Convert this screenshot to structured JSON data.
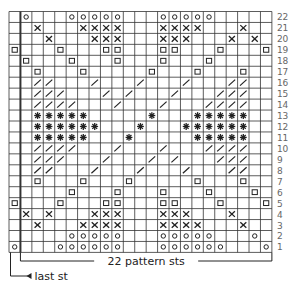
{
  "chart_data": {
    "type": "knitting-chart",
    "columns": 23,
    "rows": 22,
    "column_order_note": "index 0 = leftmost column (last st); indices 1-22 = pattern stitches",
    "legend_symbols": {
      "o": "circle",
      "x": "cross",
      "sq": "small-square",
      "sl": "diagonal-slash",
      "st": "asterisk"
    },
    "grid": [
      {
        "row": 22,
        "o": [
          1,
          5,
          6,
          7,
          8,
          9,
          13,
          14,
          15,
          16,
          17
        ]
      },
      {
        "row": 21,
        "x": [
          2,
          6,
          7,
          8,
          9,
          13,
          14,
          15,
          16,
          20
        ]
      },
      {
        "row": 20,
        "x": [
          3,
          7,
          8,
          9,
          13,
          14,
          15,
          19,
          21
        ]
      },
      {
        "row": 19,
        "sq": [
          0,
          4,
          8,
          9,
          13,
          14,
          18,
          22
        ]
      },
      {
        "row": 18,
        "sq": [
          1,
          5,
          9,
          13,
          17
        ]
      },
      {
        "row": 17,
        "sq": [
          2,
          6,
          12,
          16,
          20
        ]
      },
      {
        "row": 16,
        "sl": [
          2,
          3,
          7,
          11,
          15,
          19,
          20
        ]
      },
      {
        "row": 15,
        "sl": [
          2,
          3,
          4,
          8,
          10,
          14,
          18,
          19,
          20
        ]
      },
      {
        "row": 14,
        "sl": [
          2,
          3,
          4,
          5,
          9,
          13,
          17,
          18,
          19,
          20
        ]
      },
      {
        "row": 13,
        "st": [
          2,
          3,
          4,
          5,
          6,
          12,
          16,
          17,
          18,
          19,
          20
        ]
      },
      {
        "row": 12,
        "st": [
          2,
          3,
          4,
          5,
          6,
          7,
          11,
          15,
          16,
          17,
          18,
          19,
          20
        ]
      },
      {
        "row": 11,
        "st": [
          2,
          3,
          4,
          5,
          6,
          10,
          16,
          17,
          18,
          19,
          20
        ]
      },
      {
        "row": 10,
        "sl": [
          2,
          3,
          4,
          5,
          9,
          13,
          17,
          18,
          19,
          20
        ]
      },
      {
        "row": 9,
        "sl": [
          2,
          3,
          4,
          8,
          12,
          14,
          18,
          19,
          20
        ]
      },
      {
        "row": 8,
        "sl": [
          2,
          3,
          7,
          11,
          15,
          19,
          20
        ]
      },
      {
        "row": 7,
        "sq": [
          2,
          6,
          10,
          16,
          20
        ]
      },
      {
        "row": 6,
        "sq": [
          5,
          9,
          13,
          17,
          21
        ]
      },
      {
        "row": 5,
        "sq": [
          0,
          4,
          8,
          9,
          13,
          14,
          18,
          22
        ]
      },
      {
        "row": 4,
        "x": [
          1,
          3,
          7,
          8,
          9,
          13,
          14,
          15,
          19
        ]
      },
      {
        "row": 3,
        "x": [
          2,
          6,
          7,
          8,
          9,
          13,
          14,
          15,
          16,
          20
        ]
      },
      {
        "row": 2,
        "o": [
          5,
          6,
          7,
          8,
          9,
          13,
          14,
          15,
          16,
          17,
          21
        ]
      },
      {
        "row": 1,
        "o": [
          0,
          4,
          5,
          6,
          7,
          8,
          9,
          13,
          14,
          15,
          16,
          17,
          18,
          22
        ]
      }
    ],
    "row_labels": [
      "22",
      "21",
      "20",
      "19",
      "18",
      "17",
      "16",
      "15",
      "14",
      "13",
      "12",
      "11",
      "10",
      "9",
      "8",
      "7",
      "6",
      "5",
      "4",
      "3",
      "2",
      "1"
    ],
    "annotations": {
      "pattern_repeat": "22 pattern sts",
      "edge": "last st"
    }
  },
  "layout": {
    "grid_left": 9,
    "grid_top": 11.5,
    "cell_w": 11.43,
    "cell_h": 10.95,
    "ink": "#222222",
    "grid_line": "#333333"
  }
}
